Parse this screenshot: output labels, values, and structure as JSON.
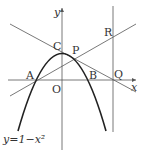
{
  "diagram": {
    "axes": {
      "x_label": "x",
      "y_label": "y",
      "origin_label": "O"
    },
    "points": {
      "A": "A",
      "B": "B",
      "C": "C",
      "P": "P",
      "Q": "Q",
      "R": "R"
    },
    "curve_label": "y=1−x²"
  }
}
